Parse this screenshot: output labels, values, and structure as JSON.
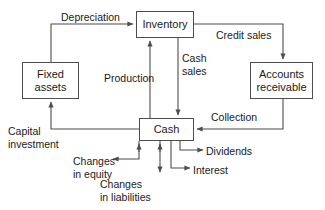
{
  "diagram": {
    "stroke_color": "#4d4d4d",
    "text_color": "#1a1a1a",
    "background_color": "#ffffff",
    "nodes": [
      {
        "id": "inventory",
        "label": "Inventory"
      },
      {
        "id": "fixed_assets",
        "label": "Fixed\nassets"
      },
      {
        "id": "accounts_receivable",
        "label": "Accounts\nreceivable"
      },
      {
        "id": "cash",
        "label": "Cash"
      }
    ],
    "edges": [
      {
        "id": "depreciation",
        "label": "Depreciation",
        "from": "fixed_assets",
        "to": "inventory"
      },
      {
        "id": "credit_sales",
        "label": "Credit sales",
        "from": "inventory",
        "to": "accounts_receivable"
      },
      {
        "id": "cash_sales",
        "label": "Cash\nsales",
        "from": "inventory",
        "to": "cash"
      },
      {
        "id": "production",
        "label": "Production",
        "from": "cash",
        "to": "inventory"
      },
      {
        "id": "collection",
        "label": "Collection",
        "from": "accounts_receivable",
        "to": "cash"
      },
      {
        "id": "capital_investment",
        "label": "Capital\ninvestment",
        "from": "cash",
        "to": "fixed_assets"
      },
      {
        "id": "changes_in_equity",
        "label": "Changes\nin equity",
        "from": "cash",
        "to": "changes_in_equity"
      },
      {
        "id": "changes_in_liabilities",
        "label": "Changes\nin liabilities",
        "from": "cash",
        "to": "changes_in_liabilities"
      },
      {
        "id": "dividends",
        "label": "Dividends",
        "from": "cash",
        "to": "dividends"
      },
      {
        "id": "interest",
        "label": "Interest",
        "from": "cash",
        "to": "interest"
      }
    ]
  }
}
